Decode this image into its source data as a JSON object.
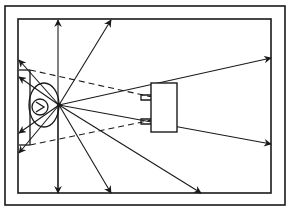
{
  "diagram": {
    "colors": {
      "line": "#1a1a1a",
      "background": "#ffffff"
    },
    "outer_wall": {
      "x": 5,
      "y": 6,
      "w": 280,
      "h": 199
    },
    "inner_wall": {
      "x": 18,
      "y": 19,
      "w": 253,
      "h": 174
    },
    "source_point": {
      "x": 59,
      "y": 105
    },
    "head": {
      "cx": 44,
      "cy": 105,
      "rx": 15,
      "ry": 22
    },
    "inner_circle": {
      "cx": 40,
      "cy": 107,
      "r": 8
    },
    "speaker": {
      "x": 151,
      "y": 83,
      "w": 26,
      "h": 49
    },
    "rays": [
      {
        "x2": 58,
        "y2": 20
      },
      {
        "x2": 111,
        "y2": 20
      },
      {
        "x2": 271,
        "y2": 58
      },
      {
        "x2": 271,
        "y2": 144
      },
      {
        "x2": 201,
        "y2": 193
      },
      {
        "x2": 111,
        "y2": 193
      },
      {
        "x2": 58,
        "y2": 193
      },
      {
        "x2": 19,
        "y2": 60
      },
      {
        "x2": 19,
        "y2": 77
      },
      {
        "x2": 19,
        "y2": 133
      },
      {
        "x2": 19,
        "y2": 153
      }
    ],
    "labels": []
  }
}
